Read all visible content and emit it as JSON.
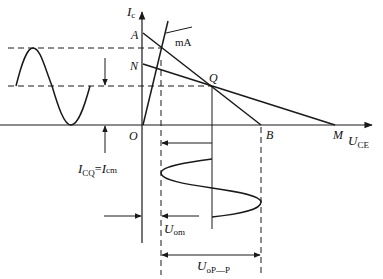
{
  "diagram": {
    "axes": {
      "y_label": {
        "main": "I",
        "sub": "c"
      },
      "x_label": {
        "main": "U",
        "sub": "CE"
      },
      "origin_label": "O"
    },
    "points": {
      "A": "A",
      "N": "N",
      "Q": "Q",
      "B": "B",
      "M": "M"
    },
    "curve_label": "mA",
    "annotations": {
      "icq": {
        "main": "I",
        "sub1": "CQ",
        "eq": "=",
        "main2": "I",
        "sub2": "cm"
      },
      "uom": {
        "main": "U",
        "sub": "om"
      },
      "uopp": {
        "main": "U",
        "sub": "oP—P"
      }
    },
    "colors": {
      "line": "#1a1a1a",
      "background": "#ffffff"
    }
  }
}
